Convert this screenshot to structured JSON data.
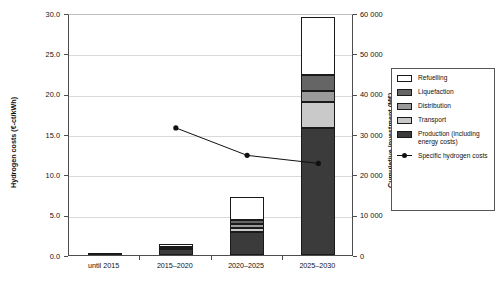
{
  "chart_data": {
    "type": "bar",
    "title": "",
    "subtitle": "",
    "categories": [
      "until 2015",
      "2015–2020",
      "2020–2025",
      "2025–2030"
    ],
    "xlabel": "",
    "ylabel": "Hydrogen costs (€-ct/kWh)",
    "y2label": "Cumulative investment (M€)",
    "ylim": [
      0.0,
      30.0
    ],
    "yticks": [
      "0.0",
      "5.0",
      "10.0",
      "15.0",
      "20.0",
      "25.0",
      "30.0"
    ],
    "ytick_values": [
      0.0,
      5.0,
      10.0,
      15.0,
      20.0,
      25.0,
      30.0
    ],
    "y2lim": [
      0,
      60000
    ],
    "y2ticks": [
      "0",
      "10 000",
      "20 000",
      "30 000",
      "40 000",
      "50 000",
      "60 000"
    ],
    "y2tick_values": [
      0,
      10000,
      20000,
      30000,
      40000,
      50000,
      60000
    ],
    "grid": true,
    "legend_position": "right-outside",
    "stacked": true,
    "series": [
      {
        "name": "Production (including energy costs)",
        "color": "#3b3b3b",
        "values": [
          0.3,
          0.8,
          2.8,
          15.7
        ]
      },
      {
        "name": "Transport",
        "color": "#c9c9c9",
        "values": [
          0.0,
          0.05,
          0.5,
          3.3
        ]
      },
      {
        "name": "Distribution",
        "color": "#9a9a9a",
        "values": [
          0.0,
          0.05,
          0.5,
          1.3
        ]
      },
      {
        "name": "Liquefaction",
        "color": "#656565",
        "values": [
          0.0,
          0.1,
          0.6,
          2.0
        ]
      },
      {
        "name": "Refuelling",
        "color": "#ffffff",
        "values": [
          0.0,
          0.35,
          2.8,
          7.2
        ]
      }
    ],
    "line_series": {
      "name": "Specific hydrogen costs",
      "color": "#111111",
      "x": [
        "2015–2020",
        "2020–2025",
        "2025–2030"
      ],
      "values": [
        16.0,
        12.6,
        11.6
      ]
    },
    "bar_totals": [
      0.3,
      1.35,
      7.2,
      29.5
    ]
  },
  "legend": {
    "items": [
      {
        "label": "Refuelling",
        "color": "#ffffff",
        "kind": "swatch"
      },
      {
        "label": "Liquefaction",
        "color": "#656565",
        "kind": "swatch"
      },
      {
        "label": "Distribution",
        "color": "#9a9a9a",
        "kind": "swatch"
      },
      {
        "label": "Transport",
        "color": "#c9c9c9",
        "kind": "swatch"
      },
      {
        "label": "Production (including energy costs)",
        "color": "#3b3b3b",
        "kind": "swatch"
      },
      {
        "label": "Specific hydrogen costs",
        "color": "#111111",
        "kind": "line-marker"
      }
    ]
  }
}
